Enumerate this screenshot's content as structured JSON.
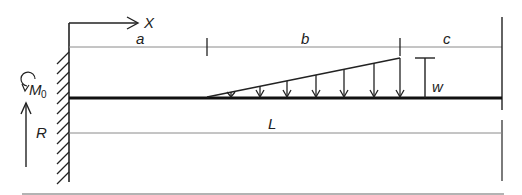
{
  "diagram": {
    "axis": {
      "label": "X"
    },
    "dimensions": {
      "a": "a",
      "b": "b",
      "c": "c",
      "L": "L"
    },
    "load": {
      "label": "w",
      "type": "linearly increasing distributed load"
    },
    "reactions": {
      "moment": "M",
      "moment_sub": "0",
      "force": "R"
    },
    "colors": {
      "beam": "#111111",
      "dimension_line": "#8a8a8a",
      "border": "#9a9a9a"
    }
  }
}
